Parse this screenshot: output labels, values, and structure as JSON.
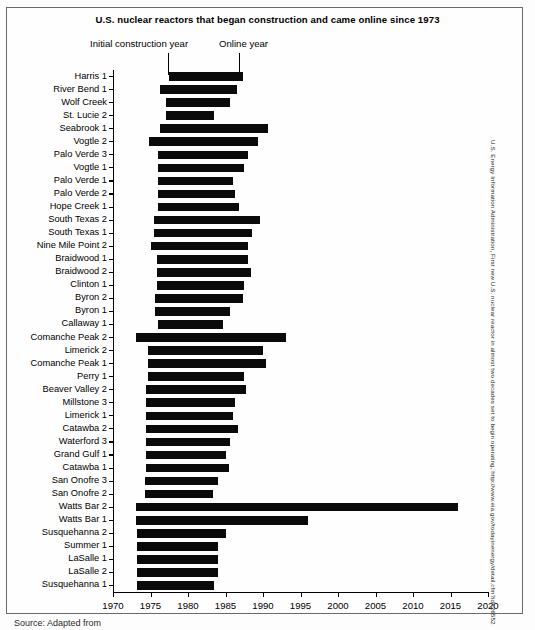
{
  "figure": {
    "title": "U.S. nuclear reactors that began construction and came online since 1973",
    "annotation_initial": "Initial construction year",
    "annotation_online": "Online year",
    "side_credit": "U.S. Energy Information Administration, First new U.S. nuclear reactor in almost two decades set to begin operating, http://www.eia.gov/todayinenergy/detail.cfm?id=26552",
    "bottom_caption": "Source: Adapted from"
  },
  "chart_data": {
    "type": "bar",
    "orientation": "horizontal",
    "subtype": "range-bar",
    "title": "U.S. nuclear reactors that began construction and came online since 1973",
    "xlabel": "",
    "ylabel": "",
    "xlim": [
      1970,
      2020
    ],
    "grid": false,
    "legend": null,
    "annotations": [
      "Initial construction year",
      "Online year"
    ],
    "xticks": [
      1970,
      1975,
      1980,
      1985,
      1990,
      1995,
      2000,
      2005,
      2010,
      2015,
      2020
    ],
    "xticklabels": [
      "1970",
      "1975",
      "1980",
      "1985",
      "1990",
      "1995",
      "2000",
      "2005",
      "2010",
      "2015",
      "2020"
    ],
    "value_keys": [
      "start",
      "end"
    ],
    "categories": [
      "Harris 1",
      "River Bend 1",
      "Wolf Creek",
      "St. Lucie 2",
      "Seabrook 1",
      "Vogtle 2",
      "Palo Verde 3",
      "Vogtle 1",
      "Palo Verde 1",
      "Palo Verde 2",
      "Hope Creek 1",
      "South Texas 2",
      "South Texas 1",
      "Nine Mile Point 2",
      "Braidwood 1",
      "Braidwood 2",
      "Clinton 1",
      "Byron 2",
      "Byron 1",
      "Callaway 1",
      "Comanche Peak 2",
      "Limerick 2",
      "Comanche Peak 1",
      "Perry 1",
      "Beaver Valley 2",
      "Millstone 3",
      "Limerick 1",
      "Catawba 2",
      "Waterford 3",
      "Grand Gulf 1",
      "Catawba 1",
      "San Onofre 3",
      "San Onofre 2",
      "Watts Bar 2",
      "Watts Bar 1",
      "Susquehanna 2",
      "Summer 1",
      "LaSalle 1",
      "LaSalle 2",
      "Susquehanna 1"
    ],
    "bars": [
      {
        "label": "Harris 1",
        "start": 1977.4,
        "end": 1987.3
      },
      {
        "label": "River Bend 1",
        "start": 1976.2,
        "end": 1986.5
      },
      {
        "label": "Wolf Creek",
        "start": 1977.0,
        "end": 1985.6
      },
      {
        "label": "St. Lucie 2",
        "start": 1977.0,
        "end": 1983.5
      },
      {
        "label": "Seabrook 1",
        "start": 1976.3,
        "end": 1990.6
      },
      {
        "label": "Vogtle 2",
        "start": 1974.8,
        "end": 1989.3
      },
      {
        "label": "Palo Verde 3",
        "start": 1976.0,
        "end": 1988.0
      },
      {
        "label": "Vogtle 1",
        "start": 1976.0,
        "end": 1987.4
      },
      {
        "label": "Palo Verde 1",
        "start": 1976.0,
        "end": 1986.0
      },
      {
        "label": "Palo Verde 2",
        "start": 1976.0,
        "end": 1986.3
      },
      {
        "label": "Hope Creek 1",
        "start": 1976.0,
        "end": 1986.8
      },
      {
        "label": "South Texas 2",
        "start": 1975.5,
        "end": 1989.6
      },
      {
        "label": "South Texas 1",
        "start": 1975.5,
        "end": 1988.5
      },
      {
        "label": "Nine Mile Point 2",
        "start": 1975.0,
        "end": 1988.0
      },
      {
        "label": "Braidwood 1",
        "start": 1975.8,
        "end": 1988.0
      },
      {
        "label": "Braidwood 2",
        "start": 1975.8,
        "end": 1988.4
      },
      {
        "label": "Clinton 1",
        "start": 1975.8,
        "end": 1987.5
      },
      {
        "label": "Byron 2",
        "start": 1975.6,
        "end": 1987.3
      },
      {
        "label": "Byron 1",
        "start": 1975.6,
        "end": 1985.6
      },
      {
        "label": "Callaway 1",
        "start": 1976.0,
        "end": 1984.6
      },
      {
        "label": "Comanche Peak 2",
        "start": 1973.0,
        "end": 1993.0
      },
      {
        "label": "Limerick 2",
        "start": 1974.6,
        "end": 1990.0
      },
      {
        "label": "Comanche Peak 1",
        "start": 1974.6,
        "end": 1990.4
      },
      {
        "label": "Perry 1",
        "start": 1974.6,
        "end": 1987.5
      },
      {
        "label": "Beaver Valley 2",
        "start": 1974.4,
        "end": 1987.7
      },
      {
        "label": "Millstone 3",
        "start": 1974.4,
        "end": 1986.3
      },
      {
        "label": "Limerick 1",
        "start": 1974.4,
        "end": 1986.0
      },
      {
        "label": "Catawba 2",
        "start": 1974.4,
        "end": 1986.6
      },
      {
        "label": "Waterford 3",
        "start": 1974.4,
        "end": 1985.6
      },
      {
        "label": "Grand Gulf 1",
        "start": 1974.4,
        "end": 1985.0
      },
      {
        "label": "Catawba 1",
        "start": 1974.4,
        "end": 1985.4
      },
      {
        "label": "San Onofre 3",
        "start": 1974.2,
        "end": 1984.0
      },
      {
        "label": "San Onofre 2",
        "start": 1974.2,
        "end": 1983.3
      },
      {
        "label": "Watts Bar 2",
        "start": 1973.0,
        "end": 2016.0
      },
      {
        "label": "Watts Bar 1",
        "start": 1973.0,
        "end": 1996.0
      },
      {
        "label": "Susquehanna 2",
        "start": 1973.2,
        "end": 1985.0
      },
      {
        "label": "Summer 1",
        "start": 1973.2,
        "end": 1984.0
      },
      {
        "label": "LaSalle 1",
        "start": 1973.2,
        "end": 1984.0
      },
      {
        "label": "LaSalle 2",
        "start": 1973.2,
        "end": 1984.0
      },
      {
        "label": "Susquehanna 1",
        "start": 1973.2,
        "end": 1983.4
      }
    ]
  }
}
